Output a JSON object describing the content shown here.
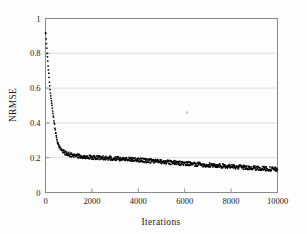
{
  "chart_data": {
    "type": "scatter",
    "title": "",
    "xlabel": "Iterations",
    "ylabel": "NRMSE",
    "xlim": [
      0,
      10000
    ],
    "ylim": [
      0,
      1
    ],
    "grid": true,
    "grid_axis": "y",
    "legend": "none",
    "marker": "filled-square",
    "marker_color": "#000000",
    "series_name": "NRMSE per iteration",
    "xticks": [
      0,
      2000,
      4000,
      6000,
      8000,
      10000
    ],
    "xtick_labels": [
      "0",
      "2000",
      "4000",
      "6000",
      "8000",
      "10000"
    ],
    "yticks": [
      0,
      0.2,
      0.4,
      0.6,
      0.8,
      1
    ],
    "ytick_labels": [
      "0",
      "0.2",
      "0.4",
      "0.6",
      "0.8",
      "1"
    ],
    "annotations": [
      {
        "label": "outlier-point",
        "x": 6100,
        "y": 0.46
      }
    ],
    "x": [
      10,
      30,
      50,
      70,
      90,
      110,
      130,
      150,
      170,
      190,
      210,
      230,
      250,
      270,
      290,
      310,
      330,
      350,
      370,
      390,
      410,
      430,
      450,
      470,
      490,
      520,
      560,
      600,
      650,
      700,
      760,
      820,
      880,
      950,
      1020,
      1100,
      1180,
      1260,
      1340,
      1420,
      1500,
      1600,
      1700,
      1800,
      1900,
      2000,
      2100,
      2200,
      2300,
      2400,
      2500,
      2600,
      2700,
      2800,
      2900,
      3000,
      3100,
      3200,
      3300,
      3400,
      3500,
      3600,
      3700,
      3800,
      3900,
      4000,
      4100,
      4200,
      4300,
      4400,
      4500,
      4600,
      4700,
      4800,
      4900,
      5000,
      5200,
      5400,
      5600,
      5800,
      6000,
      6200,
      6400,
      6600,
      6800,
      7000,
      7200,
      7400,
      7600,
      7800,
      8000,
      8200,
      8400,
      8600,
      8800,
      9000,
      9200,
      9400,
      9600,
      9800,
      10000
    ],
    "y": [
      0.92,
      0.88,
      0.84,
      0.8,
      0.77,
      0.73,
      0.7,
      0.67,
      0.63,
      0.6,
      0.57,
      0.55,
      0.53,
      0.51,
      0.49,
      0.47,
      0.45,
      0.43,
      0.41,
      0.39,
      0.37,
      0.35,
      0.335,
      0.32,
      0.305,
      0.29,
      0.275,
      0.262,
      0.25,
      0.242,
      0.235,
      0.228,
      0.224,
      0.221,
      0.219,
      0.216,
      0.214,
      0.212,
      0.211,
      0.21,
      0.209,
      0.207,
      0.206,
      0.205,
      0.204,
      0.203,
      0.202,
      0.201,
      0.2,
      0.199,
      0.198,
      0.197,
      0.197,
      0.196,
      0.195,
      0.194,
      0.194,
      0.193,
      0.192,
      0.192,
      0.191,
      0.19,
      0.19,
      0.189,
      0.188,
      0.187,
      0.186,
      0.185,
      0.184,
      0.183,
      0.182,
      0.181,
      0.18,
      0.179,
      0.178,
      0.177,
      0.175,
      0.173,
      0.171,
      0.169,
      0.167,
      0.165,
      0.163,
      0.161,
      0.159,
      0.158,
      0.156,
      0.154,
      0.152,
      0.151,
      0.149,
      0.147,
      0.146,
      0.144,
      0.142,
      0.141,
      0.139,
      0.138,
      0.136,
      0.134,
      0.132
    ],
    "noise_amplitude": 0.012
  }
}
